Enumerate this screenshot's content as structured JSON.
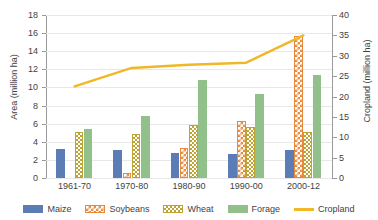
{
  "chart_data": {
    "type": "bar",
    "title": "",
    "subtitle": "",
    "xlabel": "",
    "ylabel": "Area (million ha)",
    "y2label": "Cropland (million ha)",
    "categories": [
      "1961-70",
      "1970-80",
      "1980-90",
      "1990-00",
      "2000-12"
    ],
    "ylim": [
      0,
      18
    ],
    "yticks": [
      0,
      2,
      4,
      6,
      8,
      10,
      12,
      14,
      16,
      18
    ],
    "y2lim": [
      0,
      40
    ],
    "y2ticks": [
      0,
      5,
      10,
      15,
      20,
      25,
      30,
      35,
      40
    ],
    "grid": true,
    "legend_position": "bottom",
    "series": [
      {
        "name": "Maize",
        "type": "bar",
        "axis": "left",
        "color": "#5B7CB4",
        "pattern": "solid",
        "values": [
          3.2,
          3.1,
          2.8,
          2.7,
          3.1
        ]
      },
      {
        "name": "Soybeans",
        "type": "bar",
        "axis": "left",
        "color": "#E8883A",
        "pattern": "checker",
        "values": [
          0,
          0.6,
          3.3,
          6.3,
          15.7
        ]
      },
      {
        "name": "Wheat",
        "type": "bar",
        "axis": "left",
        "color": "#BFA434",
        "pattern": "checker",
        "values": [
          5.1,
          4.9,
          5.8,
          5.6,
          5.1
        ]
      },
      {
        "name": "Forage",
        "type": "bar",
        "axis": "left",
        "color": "#92C08B",
        "pattern": "solid",
        "values": [
          5.45,
          6.85,
          10.85,
          9.3,
          11.4
        ]
      },
      {
        "name": "Cropland",
        "type": "line",
        "axis": "right",
        "color": "#F0B828",
        "pattern": "line",
        "values": [
          22.5,
          27.0,
          27.8,
          28.3,
          35.0
        ]
      }
    ]
  },
  "legend": {
    "items": [
      {
        "label": "Maize"
      },
      {
        "label": "Soybeans"
      },
      {
        "label": "Wheat"
      },
      {
        "label": "Forage"
      },
      {
        "label": "Cropland"
      }
    ]
  },
  "colors": {
    "maize": "#5B7CB4",
    "soybeans": "#E8883A",
    "wheat": "#BFA434",
    "forage": "#92C08B",
    "cropland": "#F0B828",
    "axis": "#9A9A9A",
    "grid": "#E8E8E8",
    "text": "#3F3F3F",
    "background": "#FFFFFF"
  }
}
